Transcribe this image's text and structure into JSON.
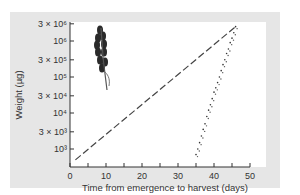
{
  "chart_data": {
    "type": "scatter",
    "title": "",
    "xlabel": "Time from emergence to harvest (days)",
    "ylabel": "Weight (µg)",
    "xlim": [
      0,
      50
    ],
    "ylim": [
      500,
      3000000
    ],
    "yscale": "log",
    "grid": false,
    "x_ticks": [
      0,
      10,
      20,
      30,
      40,
      50
    ],
    "x_tick_labels": [
      "0",
      "10",
      "20",
      "30",
      "40",
      "50"
    ],
    "y_ticks": [
      1000,
      3000,
      10000,
      30000,
      100000,
      300000,
      1000000,
      3000000
    ],
    "y_tick_labels": [
      "10³",
      "3 × 10³",
      "10⁴",
      "3 × 10⁴",
      "10⁵",
      "3 × 10⁵",
      "10⁶",
      "3 × 10⁶"
    ],
    "series": [
      {
        "name": "Exponential reference (dashed line)",
        "style": "dashed",
        "x": [
          1.5,
          46
        ],
        "y": [
          500,
          2500000
        ]
      },
      {
        "name": "Measured plant weight (dots)",
        "style": "dots",
        "x": [
          35,
          35.5,
          36,
          36.5,
          37,
          37.5,
          38,
          38.5,
          39,
          39.5,
          40,
          40.5,
          41,
          41.5,
          42,
          42.5,
          43,
          43.5,
          44,
          44.5,
          45,
          45.5,
          46
        ],
        "y": [
          700,
          1000,
          1500,
          2300,
          3500,
          5000,
          8000,
          12000,
          17000,
          25000,
          38000,
          50000,
          70000,
          100000,
          150000,
          220000,
          300000,
          450000,
          600000,
          900000,
          1200000,
          1700000,
          2500000
        ]
      }
    ],
    "annotations": [
      "plant illustration (inflorescence) in upper-left of plot"
    ]
  },
  "illustration": {
    "name": "plant-inflorescence"
  }
}
